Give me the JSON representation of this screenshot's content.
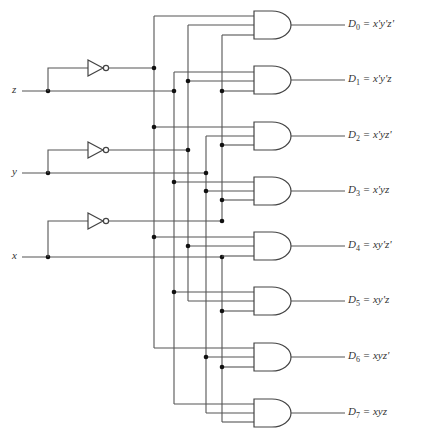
{
  "inputs": [
    {
      "name": "z",
      "y": 91,
      "inv_y": 68,
      "label_x": 12
    },
    {
      "name": "y",
      "y": 173,
      "inv_y": 150,
      "label_x": 12
    },
    {
      "name": "x",
      "y": 257,
      "inv_y": 221,
      "label_x": 12
    }
  ],
  "columns": {
    "z_not": 154,
    "z": 174,
    "y_not": 188,
    "y": 206,
    "x_not": 222,
    "x": 222
  },
  "outputs": [
    {
      "sub": "0",
      "expr": "x'y'z'",
      "center_y": 25
    },
    {
      "sub": "1",
      "expr": "x'y'z",
      "center_y": 80
    },
    {
      "sub": "2",
      "expr": "x'yz'",
      "center_y": 136
    },
    {
      "sub": "3",
      "expr": "x'yz",
      "center_y": 191
    },
    {
      "sub": "4",
      "expr": "xy'z'",
      "center_y": 246
    },
    {
      "sub": "5",
      "expr": "xy'z",
      "center_y": 301
    },
    {
      "sub": "6",
      "expr": "xyz'",
      "center_y": 357
    },
    {
      "sub": "7",
      "expr": "xyz",
      "center_y": 413
    }
  ],
  "gate_inputs": [
    [
      [
        "z_not",
        16
      ],
      [
        "y_not",
        25
      ],
      [
        "x_not",
        35
      ]
    ],
    [
      [
        "z",
        72
      ],
      [
        "y_not",
        81
      ],
      [
        "x_not",
        91
      ]
    ],
    [
      [
        "z_not",
        127
      ],
      [
        "y",
        136
      ],
      [
        "x_not",
        145
      ]
    ],
    [
      [
        "z",
        182
      ],
      [
        "y",
        191
      ],
      [
        "x_not",
        200
      ]
    ],
    [
      [
        "z_not",
        237
      ],
      [
        "y_not",
        246
      ],
      [
        "x",
        256
      ]
    ],
    [
      [
        "z",
        292
      ],
      [
        "y_not",
        301
      ],
      [
        "x",
        311
      ]
    ],
    [
      [
        "z_not",
        348
      ],
      [
        "y",
        357
      ],
      [
        "x",
        367
      ]
    ],
    [
      [
        "z",
        404
      ],
      [
        "y",
        413
      ],
      [
        "x",
        422
      ]
    ]
  ],
  "labels": {
    "eq": " = ",
    "D": "D"
  },
  "colors": {
    "wire": "#555555",
    "dot": "#111111",
    "text": "#333333"
  }
}
